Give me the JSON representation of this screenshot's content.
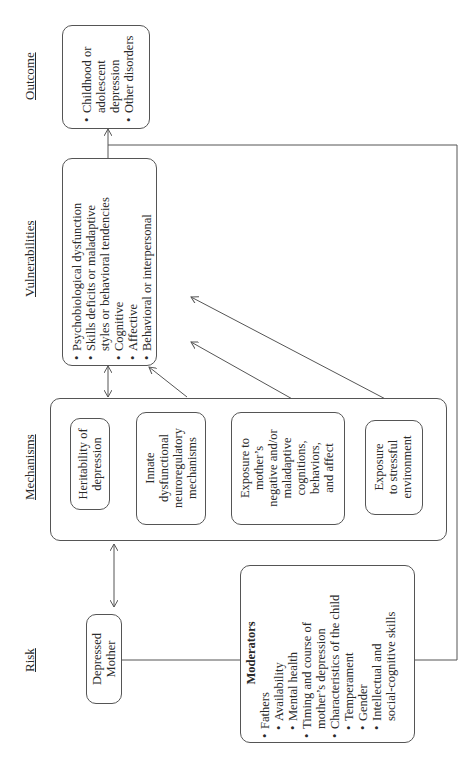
{
  "headers": {
    "outcome": "Outcome",
    "vulnerabilities": "Vulnerabilities",
    "mechanisms": "Mechanisms",
    "risk": "Risk"
  },
  "outcome_box": {
    "items": [
      "Childhood or",
      "adolescent",
      "depression",
      "Other disorders"
    ]
  },
  "vulnerabilities_box": {
    "items": [
      {
        "text": "Psychobiological dysfunction",
        "level": 0
      },
      {
        "text": "Skills deficits or maladaptive",
        "level": 0
      },
      {
        "text": "styles or behavioral tendencies",
        "level": -1
      },
      {
        "text": "Cognitive",
        "level": 1
      },
      {
        "text": "Affective",
        "level": 1
      },
      {
        "text": "Behavioral or interpersonal",
        "level": 1
      }
    ]
  },
  "mechanisms": {
    "heritability": [
      "Heritability of",
      "depression"
    ],
    "innate": [
      "Innate",
      "dysfunctional",
      "neuroregulatory",
      "mechanisms"
    ],
    "exposure_mother": [
      "Exposure to",
      "mother’s",
      "negative and/or",
      "maladaptive",
      "cognitions,",
      "behaviors,",
      "and affect"
    ],
    "exposure_stress": [
      "Exposure",
      "to stressful",
      "environment"
    ]
  },
  "risk_box": [
    "Depressed",
    "Mother"
  ],
  "moderators_box": {
    "title": "Moderators",
    "items": [
      {
        "text": "Fathers",
        "level": 0
      },
      {
        "text": "Availability",
        "level": 1
      },
      {
        "text": "Mental health",
        "level": 1
      },
      {
        "text": "Timing and course of",
        "level": 0
      },
      {
        "text": "mother’s depression",
        "level": -1
      },
      {
        "text": "Characteristics of the child",
        "level": 0
      },
      {
        "text": "Temperament",
        "level": 1
      },
      {
        "text": "Gender",
        "level": 1
      },
      {
        "text": "Intellectual and",
        "level": 1
      },
      {
        "text": "social-cognitive skills",
        "level": -2
      }
    ]
  },
  "colors": {
    "line": "#555555",
    "text": "#2a2a2a",
    "background": "#ffffff"
  }
}
